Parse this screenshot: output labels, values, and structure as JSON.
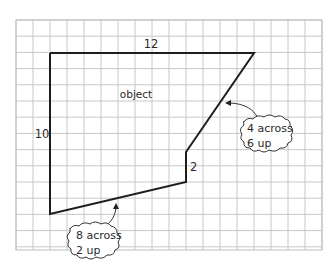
{
  "diagram": {
    "type": "grid polygon with dimension callouts",
    "grid": {
      "columns": 18,
      "rows": 14,
      "line_color": "#c8c8c8"
    },
    "shape": {
      "label": "object",
      "stroke_color": "#1e1e1e",
      "vertices_grid": [
        [
          2,
          2
        ],
        [
          14,
          2
        ],
        [
          10,
          8
        ],
        [
          10,
          10
        ],
        [
          2,
          12
        ]
      ]
    },
    "dimensions": {
      "top": "12",
      "left": "10",
      "short_vertical": "2"
    },
    "callouts": [
      {
        "id": "slope-upper",
        "line1": "4 across",
        "line2": "6 up"
      },
      {
        "id": "slope-lower",
        "line1": "8 across",
        "line2": "2 up"
      }
    ]
  }
}
